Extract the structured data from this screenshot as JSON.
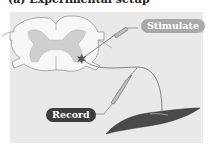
{
  "figure": {
    "heading_partial": "(a) Experimental setup",
    "labels": {
      "stimulate": "Stimulate",
      "record": "Record"
    },
    "icons": [
      "spinal-cord-cross-section",
      "stimulating-electrode",
      "recording-electrode",
      "neuron-cell-body",
      "motor-axon",
      "muscle"
    ],
    "colors": {
      "panel_bg": "#e9e9e9",
      "white_matter": "#f7f7f7",
      "gray_matter": "#cfcfcf",
      "stimulate_label_bg": "#a9a9a9",
      "record_label_bg": "#3d3d3d",
      "muscle": "#4a4a4a"
    }
  }
}
